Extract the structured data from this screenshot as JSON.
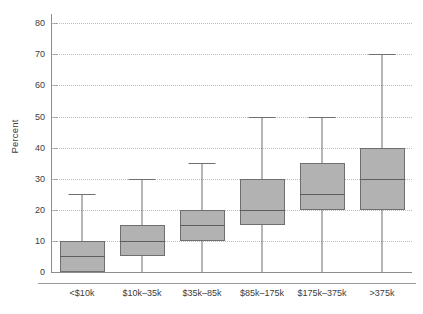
{
  "chart_data": {
    "type": "box",
    "title": "",
    "subtitle": "",
    "xlabel": "",
    "ylabel": "Percent",
    "ylim": [
      0,
      83
    ],
    "yticks": [
      0,
      10,
      20,
      30,
      40,
      50,
      60,
      70,
      80
    ],
    "ytick_labels": [
      "0",
      "10",
      "20",
      "30",
      "40",
      "50",
      "60",
      "70",
      "80"
    ],
    "grid": "horizontal-dotted",
    "legend": "none",
    "categories": [
      "<$10k",
      "$10k–35k",
      "$35k–85k",
      "$85k–175k",
      "$175k–375k",
      ">375k"
    ],
    "boxes": [
      {
        "category": "<$10k",
        "whisker_low": 0,
        "q1": 0,
        "median": 5,
        "q3": 10,
        "whisker_high": 25
      },
      {
        "category": "$10k–35k",
        "whisker_low": 0,
        "q1": 5,
        "median": 10,
        "q3": 15,
        "whisker_high": 30
      },
      {
        "category": "$35k–85k",
        "whisker_low": 0,
        "q1": 10,
        "median": 15,
        "q3": 20,
        "whisker_high": 35
      },
      {
        "category": "$85k–175k",
        "whisker_low": 0,
        "q1": 15,
        "median": 20,
        "q3": 30,
        "whisker_high": 50
      },
      {
        "category": "$175k–375k",
        "whisker_low": 0,
        "q1": 20,
        "median": 25,
        "q3": 35,
        "whisker_high": 50
      },
      {
        "category": ">375k",
        "whisker_low": 0,
        "q1": 20,
        "median": 30,
        "q3": 40,
        "whisker_high": 70
      }
    ],
    "colors": {
      "box_fill": "#b2b2b2",
      "box_edge": "#6f6f6f",
      "median": "#5e5e5e",
      "grid": "#bcbcc4",
      "axis": "#8d8d8d",
      "text": "#3c3c3c",
      "background": "#ffffff"
    }
  }
}
